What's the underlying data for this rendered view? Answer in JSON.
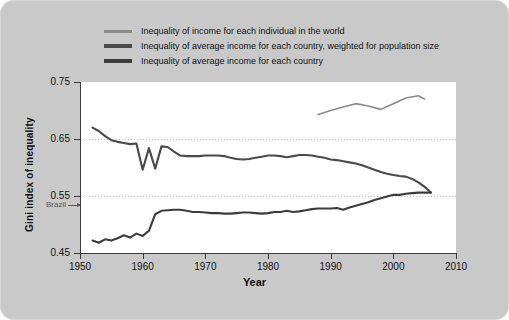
{
  "figure": {
    "background_color": "#c9c9c9",
    "plot_background": "#ffffff"
  },
  "legend": {
    "position": "top-center",
    "items": [
      {
        "label": "Inequality of income for each individual in the world",
        "color": "#8a8a8a",
        "swatch_name": "legend-swatch-world-individual"
      },
      {
        "label": "Inequality of average income for each country, weighted for population size",
        "color": "#4a4a4a",
        "swatch_name": "legend-swatch-country-weighted"
      },
      {
        "label": "Inequality of average income for each country",
        "color": "#3c3c3c",
        "swatch_name": "legend-swatch-country-unweighted"
      }
    ]
  },
  "axes": {
    "xlabel": "Year",
    "ylabel": "Gini index of inequality",
    "xticks": [
      1950,
      1960,
      1970,
      1980,
      1990,
      2000,
      2010
    ],
    "yticks": [
      "0.75",
      "0.65",
      "0.55",
      "0.45"
    ],
    "ytick_values": [
      0.75,
      0.65,
      0.55,
      0.45
    ],
    "xlim": [
      1950,
      2010
    ],
    "ylim": [
      0.45,
      0.75
    ],
    "grid": "horizontal-dotted"
  },
  "annotations": {
    "brazil_label": "Brazil",
    "brazil_value": 0.535
  },
  "chart_data": {
    "type": "line",
    "title": "",
    "xlabel": "Year",
    "ylabel": "Gini index of inequality",
    "xlim": [
      1950,
      2010
    ],
    "ylim": [
      0.45,
      0.75
    ],
    "grid": true,
    "legend_position": "top-center",
    "series": [
      {
        "name": "Inequality of income for each individual in the world",
        "color": "#8a8a8a",
        "x": [
          1988,
          1990,
          1992,
          1994,
          1996,
          1998,
          2000,
          2002,
          2004,
          2005
        ],
        "values": [
          0.693,
          0.7,
          0.706,
          0.712,
          0.708,
          0.702,
          0.712,
          0.722,
          0.726,
          0.72
        ]
      },
      {
        "name": "Inequality of average income for each country, weighted for population size",
        "color": "#4a4a4a",
        "x": [
          1952,
          1953,
          1954,
          1955,
          1956,
          1957,
          1958,
          1959,
          1960,
          1961,
          1962,
          1963,
          1964,
          1965,
          1966,
          1967,
          1968,
          1969,
          1970,
          1971,
          1972,
          1973,
          1974,
          1975,
          1976,
          1977,
          1978,
          1979,
          1980,
          1981,
          1982,
          1983,
          1984,
          1985,
          1986,
          1987,
          1988,
          1989,
          1990,
          1991,
          1992,
          1993,
          1994,
          1995,
          1996,
          1997,
          1998,
          1999,
          2000,
          2001,
          2002,
          2003,
          2004,
          2005,
          2006
        ],
        "values": [
          0.67,
          0.664,
          0.655,
          0.648,
          0.645,
          0.643,
          0.641,
          0.642,
          0.596,
          0.634,
          0.598,
          0.637,
          0.636,
          0.628,
          0.621,
          0.62,
          0.62,
          0.62,
          0.621,
          0.621,
          0.621,
          0.62,
          0.617,
          0.615,
          0.614,
          0.615,
          0.617,
          0.619,
          0.621,
          0.621,
          0.62,
          0.618,
          0.62,
          0.622,
          0.622,
          0.621,
          0.619,
          0.617,
          0.614,
          0.613,
          0.611,
          0.609,
          0.607,
          0.604,
          0.6,
          0.596,
          0.592,
          0.589,
          0.587,
          0.585,
          0.584,
          0.58,
          0.574,
          0.566,
          0.556
        ]
      },
      {
        "name": "Inequality of average income for each country",
        "color": "#3c3c3c",
        "x": [
          1952,
          1953,
          1954,
          1955,
          1956,
          1957,
          1958,
          1959,
          1960,
          1961,
          1962,
          1963,
          1964,
          1965,
          1966,
          1967,
          1968,
          1969,
          1970,
          1971,
          1972,
          1973,
          1974,
          1975,
          1976,
          1977,
          1978,
          1979,
          1980,
          1981,
          1982,
          1983,
          1984,
          1985,
          1986,
          1987,
          1988,
          1989,
          1990,
          1991,
          1992,
          1993,
          1994,
          1995,
          1996,
          1997,
          1998,
          1999,
          2000,
          2001,
          2002,
          2003,
          2004,
          2005,
          2006
        ],
        "values": [
          0.472,
          0.468,
          0.474,
          0.472,
          0.476,
          0.481,
          0.477,
          0.484,
          0.48,
          0.489,
          0.518,
          0.524,
          0.525,
          0.526,
          0.526,
          0.524,
          0.522,
          0.522,
          0.521,
          0.52,
          0.52,
          0.519,
          0.519,
          0.52,
          0.521,
          0.521,
          0.52,
          0.519,
          0.52,
          0.522,
          0.522,
          0.524,
          0.522,
          0.523,
          0.525,
          0.527,
          0.528,
          0.528,
          0.528,
          0.529,
          0.526,
          0.53,
          0.533,
          0.536,
          0.539,
          0.543,
          0.546,
          0.549,
          0.552,
          0.552,
          0.554,
          0.555,
          0.556,
          0.556,
          0.556
        ]
      }
    ]
  }
}
